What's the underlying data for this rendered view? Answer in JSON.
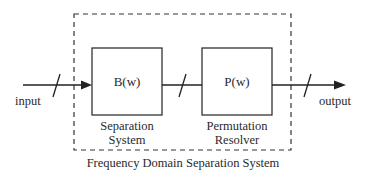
{
  "diagram": {
    "caption": "Frequency Domain Separation System",
    "input_label": "input",
    "output_label": "output",
    "blocks": [
      {
        "id": "separation",
        "symbol": "B(w)",
        "label_line1": "Separation",
        "label_line2": "System"
      },
      {
        "id": "permutation",
        "symbol": "P(w)",
        "label_line1": "Permutation",
        "label_line2": "Resolver"
      }
    ],
    "connections": [
      {
        "from": "input",
        "to": "B(w)",
        "bus_slash": true,
        "arrow": true
      },
      {
        "from": "B(w)",
        "to": "P(w)",
        "bus_slash": true,
        "arrow": false
      },
      {
        "from": "P(w)",
        "to": "output",
        "bus_slash": true,
        "arrow": true
      }
    ],
    "enclosure": {
      "style": "dashed",
      "label": "Frequency Domain Separation System"
    },
    "colors": {
      "stroke": "#222222",
      "background": "#ffffff"
    }
  }
}
